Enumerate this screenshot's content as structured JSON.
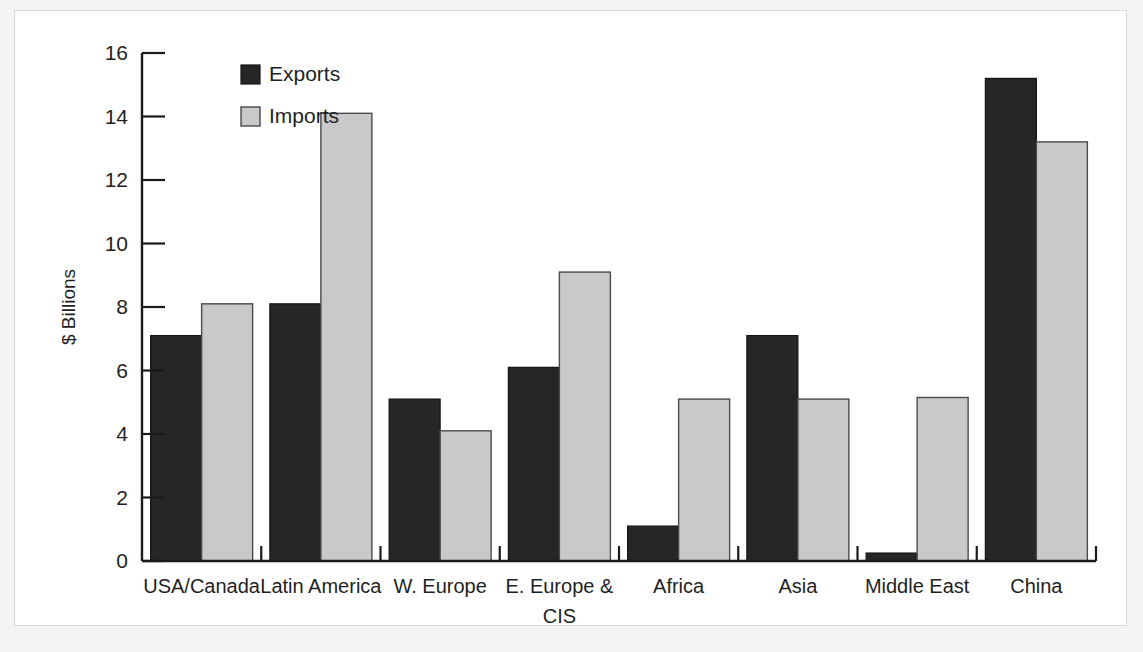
{
  "chart_data": {
    "type": "bar",
    "title": "",
    "subtitle": "",
    "xlabel": "",
    "ylabel": "$ Billions",
    "ylim": [
      0,
      16
    ],
    "ytick_step": 2,
    "yticks": [
      "0",
      "2",
      "4",
      "6",
      "8",
      "10",
      "12",
      "14",
      "16"
    ],
    "grid": false,
    "legend_position": "top-left-inside",
    "categories": [
      "USA/Canada",
      "Latin America",
      "W. Europe",
      "E. Europe & CIS",
      "Africa",
      "Asia",
      "Middle East",
      "China"
    ],
    "series": [
      {
        "name": "Exports",
        "color": "#262626",
        "values": [
          7.1,
          8.1,
          5.1,
          6.1,
          1.1,
          7.1,
          0.25,
          15.2
        ]
      },
      {
        "name": "Imports",
        "color": "#c9c9c9",
        "values": [
          8.1,
          14.1,
          4.1,
          9.1,
          5.1,
          5.1,
          5.15,
          13.2
        ]
      }
    ]
  },
  "legend": {
    "entries": [
      {
        "label": "Exports",
        "swatch": "exports-swatch"
      },
      {
        "label": "Imports",
        "swatch": "imports-swatch"
      }
    ]
  },
  "colors": {
    "exports": "#262626",
    "imports": "#c9c9c9",
    "axis": "#1a1a1a",
    "plate": "#ffffff",
    "mat": "#f4f4f4",
    "frame": "#d8d8d8"
  }
}
